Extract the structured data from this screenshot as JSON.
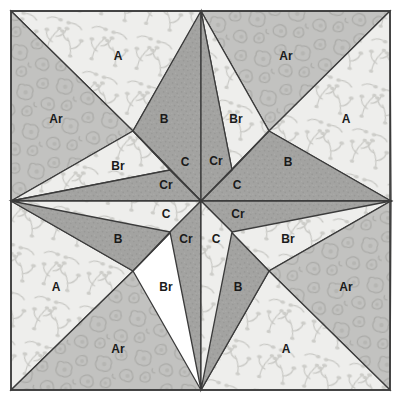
{
  "diagram": {
    "kind": "quilt-block",
    "background_color": "#ffffff",
    "border_color": "#3b3b3b",
    "block_bounds": {
      "x": 11,
      "y": 11,
      "width": 379,
      "height": 379
    },
    "center": {
      "x": 201,
      "y": 201
    }
  },
  "fabrics": [
    {
      "key": "A",
      "label": "A",
      "name": "light-sprig-print",
      "fill": "#eeeeec",
      "motif": "sprig",
      "motif_color": "#c6c6c2"
    },
    {
      "key": "Ar",
      "label": "Ar",
      "name": "medium-cloud-print",
      "fill": "#c2c2c0",
      "motif": "cloud",
      "motif_color": "#a9a9a6"
    },
    {
      "key": "B",
      "label": "B",
      "name": "dark-solid-speckle",
      "fill": "#a3a3a1",
      "motif": "speckle",
      "motif_color": "#969694"
    },
    {
      "key": "Br",
      "label": "Br",
      "name": "light-sprig-print-reverse",
      "fill": "#eeeeec",
      "motif": "sprig",
      "motif_color": "#c6c6c2"
    },
    {
      "key": "C",
      "label": "C",
      "name": "light-sprig-print-small",
      "fill": "#eeeeec",
      "motif": "sprig",
      "motif_color": "#c6c6c2"
    },
    {
      "key": "Cr",
      "label": "Cr",
      "name": "dark-solid-speckle-small",
      "fill": "#a3a3a1",
      "motif": "speckle",
      "motif_color": "#969694"
    }
  ],
  "pieces": [
    {
      "id": "p01",
      "fabric": "A",
      "label": "A",
      "points": "11,11 201,11 201,12 133,131 11,11",
      "label_x": 118,
      "label_y": 57
    },
    {
      "id": "p02",
      "fabric": "Ar",
      "label": "Ar",
      "points": "11,11 133,131 11,201",
      "label_x": 56,
      "label_y": 120
    },
    {
      "id": "p03",
      "fabric": "Br",
      "label": "Br",
      "points": "133,131 170,170 11,201",
      "label_x": 118,
      "label_y": 167
    },
    {
      "id": "p04",
      "fabric": "B",
      "label": "B",
      "points": "201,11 201,201 133,131",
      "label_x": 164,
      "label_y": 120
    },
    {
      "id": "p05",
      "fabric": "Cr",
      "label": "Cr",
      "points": "170,170 201,201 11,201",
      "label_x": 166,
      "label_y": 186
    },
    {
      "id": "p06",
      "fabric": "C",
      "label": "C",
      "points": "133,131 201,201 170,170",
      "label_x": 185,
      "label_y": 163
    },
    {
      "id": "p07",
      "fabric": "Ar",
      "label": "Ar",
      "points": "201,11 390,11 269,131 201,11",
      "label_x": 286,
      "label_y": 57
    },
    {
      "id": "p08",
      "fabric": "A",
      "label": "A",
      "points": "390,11 391,201 269,131",
      "label_x": 346,
      "label_y": 120
    },
    {
      "id": "p09",
      "fabric": "Br",
      "label": "Br",
      "points": "201,11 269,131 232,170",
      "label_x": 236,
      "label_y": 120
    },
    {
      "id": "p10",
      "fabric": "B",
      "label": "B",
      "points": "269,131 391,201 201,201",
      "label_x": 288,
      "label_y": 163
    },
    {
      "id": "p11",
      "fabric": "Cr",
      "label": "Cr",
      "points": "201,11 232,170 201,201",
      "label_x": 216,
      "label_y": 162
    },
    {
      "id": "p12",
      "fabric": "C",
      "label": "C",
      "points": "232,170 269,131 201,201",
      "label_x": 237,
      "label_y": 186
    },
    {
      "id": "p13",
      "fabric": "A",
      "label": "A",
      "points": "11,201 133,271 11,390",
      "label_x": 56,
      "label_y": 288
    },
    {
      "id": "p14",
      "fabric": "Ar",
      "label": "Ar",
      "points": "11,390 133,271 201,390",
      "label_x": 118,
      "label_y": 350
    },
    {
      "id": "p15",
      "fabric": "B",
      "label": "B",
      "points": "11,201 201,201 133,271",
      "label_x": 118,
      "label_y": 240
    },
    {
      "id": "p16",
      "fabric": "Br",
      "label": "Br",
      "points": "133,271 201,201 170,232",
      "label_x": 166,
      "label_y": 288
    },
    {
      "id": "p17",
      "fabric": "C",
      "label": "C",
      "points": "11,201 170,232 201,201",
      "label_x": 166,
      "label_y": 215
    },
    {
      "id": "p18",
      "fabric": "Cr",
      "label": "Cr",
      "points": "170,232 201,390 201,201",
      "label_x": 186,
      "label_y": 240
    },
    {
      "id": "p19",
      "fabric": "Br",
      "label": "Br",
      "points": "201,201 269,271 391,201",
      "label_x": 288,
      "label_y": 240
    },
    {
      "id": "p20",
      "fabric": "Ar",
      "label": "Ar",
      "points": "269,271 390,390 391,201",
      "label_x": 346,
      "label_y": 288
    },
    {
      "id": "p21",
      "fabric": "A",
      "label": "A",
      "points": "201,390 269,271 390,390",
      "label_x": 286,
      "label_y": 350
    },
    {
      "id": "p22",
      "fabric": "B",
      "label": "B",
      "points": "201,201 201,390 269,271",
      "label_x": 238,
      "label_y": 288
    },
    {
      "id": "p23",
      "fabric": "Cr",
      "label": "Cr",
      "points": "201,201 391,201 232,232",
      "label_x": 238,
      "label_y": 215
    },
    {
      "id": "p24",
      "fabric": "C",
      "label": "C",
      "points": "201,201 232,232 201,390",
      "label_x": 216,
      "label_y": 240
    }
  ],
  "labels": {
    "A": "A",
    "Ar": "Ar",
    "B": "B",
    "Br": "Br",
    "C": "C",
    "Cr": "Cr"
  }
}
